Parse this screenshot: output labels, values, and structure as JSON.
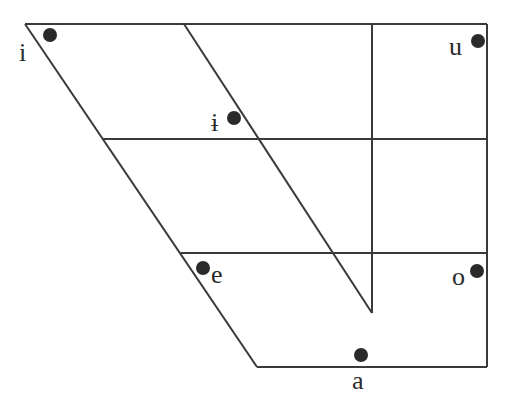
{
  "diagram": {
    "type": "vowel-trapezoid",
    "vowels": [
      {
        "symbol": "i",
        "position": "close front"
      },
      {
        "symbol": "ɨ",
        "position": "close central"
      },
      {
        "symbol": "u",
        "position": "close back"
      },
      {
        "symbol": "e",
        "position": "close-mid front"
      },
      {
        "symbol": "o",
        "position": "close-mid back"
      },
      {
        "symbol": "a",
        "position": "open central"
      }
    ]
  },
  "labels": {
    "i": "i",
    "i_bar": "ɨ",
    "u": "u",
    "e": "e",
    "o": "o",
    "a": "a"
  }
}
